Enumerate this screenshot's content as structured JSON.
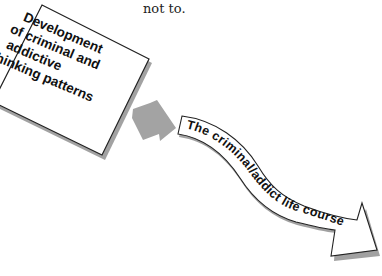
{
  "page": {
    "text_fragment": "not to."
  },
  "diagram": {
    "source_box": {
      "lines": [
        "Development",
        "of criminal and",
        "addictive",
        "thinking patterns"
      ],
      "border_color": "#222222",
      "fill_color": "#ffffff",
      "rotation_deg": 23
    },
    "connector_arrow": {
      "icon": "arrow-down-right-icon",
      "color": "#a3a3a3"
    },
    "target_banner": {
      "label": "The criminal/addict life course",
      "shape": "wavy-arrow",
      "border_color": "#222222",
      "fill_color": "#ffffff"
    }
  }
}
